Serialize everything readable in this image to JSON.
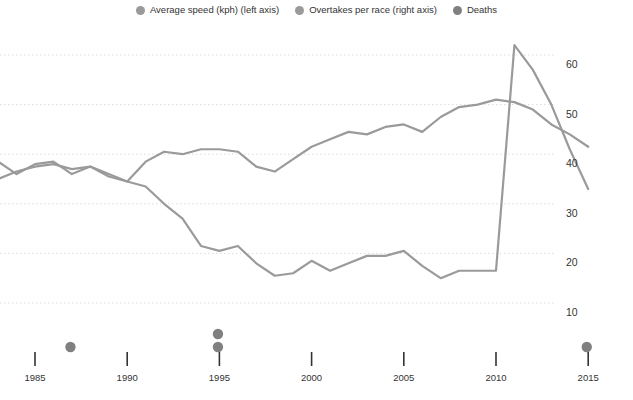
{
  "legend": {
    "items": [
      {
        "label": "Average speed (kph) (left axis)",
        "color": "#9a9a9a",
        "icon": "legend-dot-icon"
      },
      {
        "label": "Overtakes per race (right axis)",
        "color": "#9a9a9a",
        "icon": "legend-dot-icon"
      },
      {
        "label": "Deaths",
        "color": "#808080",
        "icon": "legend-dot-icon"
      }
    ]
  },
  "chart_data": {
    "type": "line",
    "title": "",
    "subtitle": "",
    "xlabel": "",
    "ylabel": "",
    "grid": true,
    "legend_position": "top-center",
    "xlim": [
      1983,
      2015
    ],
    "x_ticks": [
      1985,
      1990,
      1995,
      2000,
      2005,
      2010,
      2015
    ],
    "x_tick_labels": [
      "1985",
      "1990",
      "1995",
      "2000",
      "2005",
      "2010",
      "2015"
    ],
    "right_axis": {
      "label": "Overtakes per race",
      "ylim": [
        5,
        65
      ],
      "ticks": [
        10,
        20,
        30,
        40,
        50,
        60
      ],
      "tick_labels": [
        "10",
        "20",
        "30",
        "40",
        "50",
        "60"
      ]
    },
    "left_axis": {
      "label": "Average speed (kph)",
      "ylim": [
        5,
        65
      ],
      "ticks": [],
      "tick_labels": []
    },
    "series": [
      {
        "name": "Average speed (kph) (left axis)",
        "axis": "left",
        "color": "#9a9a9a",
        "x": [
          1983,
          1984,
          1985,
          1986,
          1987,
          1988,
          1989,
          1990,
          1991,
          1992,
          1993,
          1994,
          1995,
          1996,
          1997,
          1998,
          1999,
          2000,
          2001,
          2002,
          2003,
          2004,
          2005,
          2006,
          2007,
          2008,
          2009,
          2010,
          2011,
          2012,
          2013,
          2014,
          2015
        ],
        "values": [
          38.5,
          36.0,
          38.0,
          38.5,
          36.0,
          37.5,
          35.5,
          34.5,
          38.5,
          40.5,
          40.0,
          41.0,
          41.0,
          40.5,
          37.5,
          36.5,
          39.0,
          41.5,
          43.0,
          44.5,
          44.0,
          45.5,
          46.0,
          44.5,
          47.5,
          49.5,
          50.0,
          51.0,
          50.5,
          49.0,
          46.0,
          44.0,
          41.5
        ],
        "note": "plotted on the left axis; gridline values shown correspond to the right axis scale"
      },
      {
        "name": "Overtakes per race (right axis)",
        "axis": "right",
        "color": "#9a9a9a",
        "x": [
          1983,
          1984,
          1985,
          1986,
          1987,
          1988,
          1989,
          1990,
          1991,
          1992,
          1993,
          1994,
          1995,
          1996,
          1997,
          1998,
          1999,
          2000,
          2001,
          2002,
          2003,
          2004,
          2005,
          2006,
          2007,
          2008,
          2009,
          2010,
          2011,
          2012,
          2013,
          2014,
          2015
        ],
        "values": [
          35.0,
          36.5,
          37.5,
          38.0,
          37.0,
          37.5,
          36.0,
          34.5,
          33.5,
          30.0,
          27.0,
          21.5,
          20.5,
          21.5,
          18.0,
          15.5,
          16.0,
          18.5,
          16.5,
          18.0,
          19.5,
          19.5,
          20.5,
          17.5,
          15.0,
          16.5,
          16.5,
          16.5,
          62.0,
          57.0,
          50.0,
          41.0,
          33.0
        ]
      },
      {
        "name": "Deaths",
        "axis": "markers",
        "color": "#808080",
        "marker": "dot",
        "points": [
          {
            "year": 1986,
            "index": 1
          },
          {
            "year": 1994,
            "index": 1
          },
          {
            "year": 1994,
            "index": 2
          },
          {
            "year": 2014,
            "index": 1
          }
        ]
      }
    ]
  },
  "colors": {
    "line": "#9a9a9a",
    "grid": "#dcdcdc",
    "axis": "#333333",
    "deaths_marker": "#808080",
    "background": "#ffffff"
  }
}
